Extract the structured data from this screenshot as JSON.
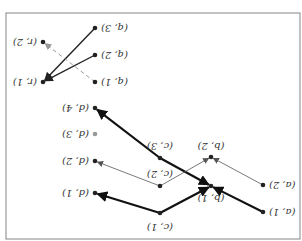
{
  "diagram": {
    "orientation": "rotated-180",
    "frame": {
      "x": 6,
      "y": 13,
      "width": 294,
      "height": 226,
      "stroke": "#999999"
    },
    "nodes": [
      {
        "id": "a1",
        "label": "(a, 1)",
        "x": 263,
        "y": 212,
        "color": "#222222"
      },
      {
        "id": "a2",
        "label": "(a, 2)",
        "x": 263,
        "y": 185,
        "color": "#222222"
      },
      {
        "id": "b1",
        "label": "(b, 1)",
        "x": 211,
        "y": 186,
        "color": "#222222"
      },
      {
        "id": "b2",
        "label": "(b, 2)",
        "x": 211,
        "y": 157,
        "color": "#222222"
      },
      {
        "id": "c1",
        "label": "(c, 1)",
        "x": 160,
        "y": 213,
        "color": "#222222"
      },
      {
        "id": "c2",
        "label": "(c, 2)",
        "x": 160,
        "y": 186,
        "color": "#222222"
      },
      {
        "id": "c3",
        "label": "(c, 3)",
        "x": 160,
        "y": 158,
        "color": "#222222"
      },
      {
        "id": "d1",
        "label": "(d, 1)",
        "x": 95,
        "y": 193,
        "color": "#222222"
      },
      {
        "id": "d2",
        "label": "(d, 2)",
        "x": 95,
        "y": 161,
        "color": "#222222"
      },
      {
        "id": "d3",
        "label": "(d, 3)",
        "x": 95,
        "y": 134,
        "color": "#999999"
      },
      {
        "id": "d4",
        "label": "(d, 4)",
        "x": 95,
        "y": 108,
        "color": "#222222"
      },
      {
        "id": "q1",
        "label": "(q, 1)",
        "x": 95,
        "y": 82,
        "color": "#222222"
      },
      {
        "id": "q2",
        "label": "(q, 2)",
        "x": 95,
        "y": 55,
        "color": "#222222"
      },
      {
        "id": "q3",
        "label": "(q, 3)",
        "x": 95,
        "y": 28,
        "color": "#222222"
      },
      {
        "id": "r1",
        "label": "(r, 1)",
        "x": 43,
        "y": 82,
        "color": "#222222"
      },
      {
        "id": "r2",
        "label": "(r, 2)",
        "x": 43,
        "y": 42,
        "color": "#222222"
      }
    ],
    "edges": [
      {
        "from": "a1",
        "to": "b1",
        "style": "heavy"
      },
      {
        "from": "c1",
        "to": "b1",
        "style": "heavy"
      },
      {
        "from": "c3",
        "to": "b1",
        "style": "heavy"
      },
      {
        "from": "c3",
        "to": "d4",
        "style": "heavy"
      },
      {
        "from": "c1",
        "to": "d1",
        "style": "heavy"
      },
      {
        "from": "a2",
        "to": "b2",
        "style": "thin"
      },
      {
        "from": "c2",
        "to": "b2",
        "style": "thin"
      },
      {
        "from": "c2",
        "to": "d2",
        "style": "thin"
      },
      {
        "from": "q3",
        "to": "r1",
        "style": "medium"
      },
      {
        "from": "q2",
        "to": "r1",
        "style": "medium"
      },
      {
        "from": "q1",
        "to": "r2",
        "style": "dashed"
      }
    ],
    "label_offsets": {
      "a1": [
        6,
        0
      ],
      "a2": [
        6,
        0
      ],
      "b1": [
        0,
        12
      ],
      "b2": [
        0,
        -11
      ],
      "c1": [
        0,
        14
      ],
      "c2": [
        0,
        -12
      ],
      "c3": [
        0,
        -12
      ],
      "d1": [
        -6,
        0
      ],
      "d2": [
        -6,
        0
      ],
      "d3": [
        -6,
        0
      ],
      "d4": [
        -6,
        0
      ],
      "q1": [
        6,
        0
      ],
      "q2": [
        6,
        0
      ],
      "q3": [
        6,
        0
      ],
      "r1": [
        -6,
        0
      ],
      "r2": [
        -6,
        0
      ]
    },
    "edge_styles": {
      "heavy": {
        "stroke": "#111111",
        "width": 2.2,
        "dash": ""
      },
      "medium": {
        "stroke": "#222222",
        "width": 1.4,
        "dash": ""
      },
      "thin": {
        "stroke": "#555555",
        "width": 0.8,
        "dash": ""
      },
      "dashed": {
        "stroke": "#999999",
        "width": 1.0,
        "dash": "4,3"
      }
    }
  }
}
